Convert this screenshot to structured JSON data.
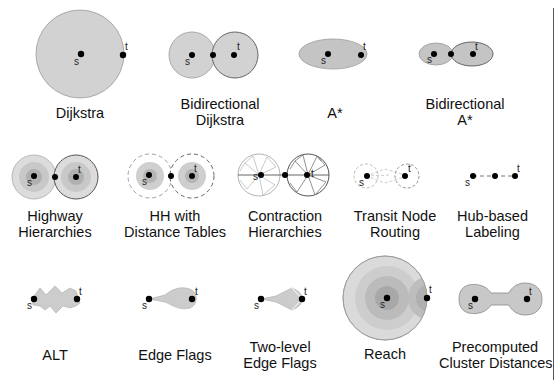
{
  "figure": {
    "colors": {
      "fill_light": "#d2d2d2",
      "fill_mid": "#c0c0c0",
      "fill_dark": "#aaaaaa",
      "fill_darker": "#9a9a9a",
      "stroke": "#777777",
      "dot": "#000000",
      "background": "#ffffff"
    },
    "node_labels": {
      "source": "s",
      "target": "t"
    },
    "techniques": [
      {
        "id": "dijkstra",
        "line1": "Dijkstra",
        "line2": ""
      },
      {
        "id": "bidirectional-dijkstra",
        "line1": "Bidirectional",
        "line2": "Dijkstra"
      },
      {
        "id": "a-star",
        "line1": "A*",
        "line2": ""
      },
      {
        "id": "bidirectional-a-star",
        "line1": "Bidirectional",
        "line2": "A*"
      },
      {
        "id": "highway-hierarchies",
        "line1": "Highway",
        "line2": "Hierarchies"
      },
      {
        "id": "hh-distance-tables",
        "line1": "HH with",
        "line2": "Distance Tables"
      },
      {
        "id": "contraction-hierarchies",
        "line1": "Contraction",
        "line2": "Hierarchies"
      },
      {
        "id": "transit-node-routing",
        "line1": "Transit Node",
        "line2": "Routing"
      },
      {
        "id": "hub-based-labeling",
        "line1": "Hub-based",
        "line2": "Labeling"
      },
      {
        "id": "alt",
        "line1": "ALT",
        "line2": ""
      },
      {
        "id": "edge-flags",
        "line1": "Edge Flags",
        "line2": ""
      },
      {
        "id": "two-level-edge-flags",
        "line1": "Two-level",
        "line2": "Edge Flags"
      },
      {
        "id": "reach",
        "line1": "Reach",
        "line2": ""
      },
      {
        "id": "precomputed-cluster-distances",
        "line1": "Precomputed",
        "line2": "Cluster Distances"
      }
    ]
  }
}
